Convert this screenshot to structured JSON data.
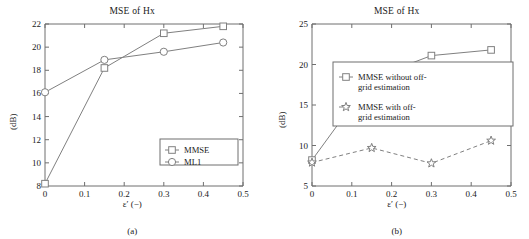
{
  "figure": {
    "panels": [
      {
        "caption": "(a)",
        "title": "MSE of Hx",
        "xlabel": "ε′ (−)",
        "ylabel": "(dB)"
      },
      {
        "caption": "(b)",
        "title": "MSE of Hx",
        "xlabel": "ε′ (−)",
        "ylabel": "(dB)"
      }
    ]
  },
  "chart_data": [
    {
      "type": "line",
      "title": "MSE of Hx",
      "xlabel": "ε′ (−)",
      "ylabel": "(dB)",
      "xlim": [
        0,
        0.5
      ],
      "ylim": [
        8,
        22
      ],
      "xticks": [
        "0",
        "0.1",
        "0.2",
        "0.3",
        "0.4",
        "0.5"
      ],
      "xtick_values": [
        0,
        0.1,
        0.2,
        0.3,
        0.4,
        0.5
      ],
      "yticks": [
        "8",
        "10",
        "12",
        "14",
        "16",
        "18",
        "20",
        "22"
      ],
      "ytick_values": [
        8,
        10,
        12,
        14,
        16,
        18,
        20,
        22
      ],
      "grid": false,
      "legend_position": "lower right",
      "x": [
        0,
        0.15,
        0.3,
        0.45
      ],
      "series": [
        {
          "name": "MMSE",
          "marker": "square",
          "linestyle": "solid",
          "color": "#808080",
          "values": [
            8.2,
            18.2,
            21.2,
            21.8
          ]
        },
        {
          "name": "ML1",
          "marker": "circle",
          "linestyle": "solid",
          "color": "#808080",
          "values": [
            16.1,
            18.9,
            19.6,
            20.4
          ]
        }
      ]
    },
    {
      "type": "line",
      "title": "MSE of Hx",
      "xlabel": "ε′ (−)",
      "ylabel": "(dB)",
      "xlim": [
        0,
        0.5
      ],
      "ylim": [
        5,
        25
      ],
      "xticks": [
        "0",
        "0.1",
        "0.2",
        "0.3",
        "0.4",
        "0.5"
      ],
      "xtick_values": [
        0,
        0.1,
        0.2,
        0.3,
        0.4,
        0.5
      ],
      "yticks": [
        "5",
        "10",
        "15",
        "20",
        "25"
      ],
      "ytick_values": [
        5,
        10,
        15,
        20,
        25
      ],
      "grid": false,
      "legend_position": "center right",
      "x": [
        0,
        0.15,
        0.3,
        0.45
      ],
      "series": [
        {
          "name": "MMSE without off-grid estimation",
          "name_line1": "MMSE without off-",
          "name_line2": "grid estimation",
          "marker": "square",
          "linestyle": "solid",
          "color": "#808080",
          "values": [
            8.2,
            18.3,
            21.1,
            21.8
          ]
        },
        {
          "name": "MMSE with off-grid estimation",
          "name_line1": "MMSE with off-",
          "name_line2": "grid estimation",
          "marker": "star",
          "linestyle": "dashed",
          "color": "#808080",
          "values": [
            7.9,
            9.7,
            7.8,
            10.6
          ]
        }
      ]
    }
  ]
}
